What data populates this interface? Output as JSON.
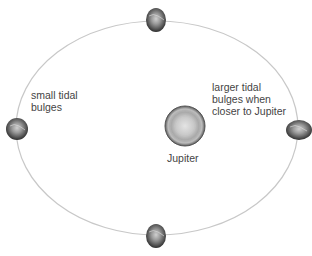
{
  "diagram": {
    "title": "",
    "central_body": {
      "name": "Jupiter",
      "label": "Jupiter"
    },
    "orbit": {
      "shape": "ellipse",
      "color": "#c8c8c8"
    },
    "moons": [
      {
        "position": "top"
      },
      {
        "position": "left"
      },
      {
        "position": "right"
      },
      {
        "position": "bottom"
      }
    ],
    "annotations": {
      "small_bulges": {
        "line1": "small tidal",
        "line2": "bulges"
      },
      "large_bulges": {
        "line1": "larger tidal",
        "line2": "bulges when",
        "line3": "closer to Jupiter"
      }
    },
    "colors": {
      "background": "#ffffff",
      "text": "#444444",
      "moon_dark": "#3a3a3a",
      "moon_light": "#bdbdbd",
      "jupiter_outer": "#6e6e6e",
      "jupiter_inner": "#cfcfcf"
    }
  }
}
